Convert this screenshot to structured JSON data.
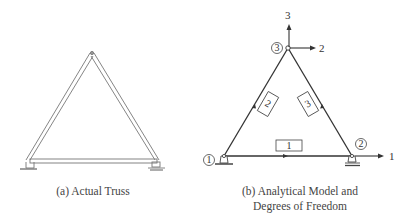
{
  "panel_a": {
    "caption": "(a) Actual Truss"
  },
  "panel_b": {
    "caption_line1": "(b) Analytical Model and",
    "caption_line2": "Degrees of Freedom",
    "nodes": [
      {
        "id": "1",
        "label": "1"
      },
      {
        "id": "2",
        "label": "2"
      },
      {
        "id": "3",
        "label": "3"
      }
    ],
    "elements": [
      {
        "id": "1",
        "label": "1"
      },
      {
        "id": "2",
        "label": "2"
      },
      {
        "id": "3",
        "label": "3"
      }
    ],
    "dofs": [
      {
        "id": "1",
        "label": "1",
        "direction": "horizontal",
        "node": "2"
      },
      {
        "id": "2",
        "label": "2",
        "direction": "horizontal",
        "node": "3"
      },
      {
        "id": "3",
        "label": "3",
        "direction": "vertical",
        "node": "3"
      }
    ]
  }
}
